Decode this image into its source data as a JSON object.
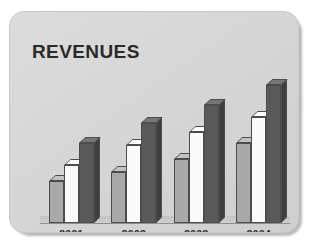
{
  "card": {
    "title": "REVENUES"
  },
  "chart_data": {
    "type": "bar",
    "title": "REVENUES",
    "xlabel": "",
    "ylabel": "",
    "categories": [
      "2001",
      "2002",
      "2003",
      "2004"
    ],
    "series": [
      {
        "name": "light-gray-series",
        "color": "#a9a9a9",
        "values": [
          38,
          46,
          58,
          72
        ]
      },
      {
        "name": "white-series",
        "color": "#fbfbfb",
        "values": [
          52,
          70,
          82,
          95
        ]
      },
      {
        "name": "dark-gray-series",
        "color": "#595959",
        "values": [
          72,
          90,
          106,
          124
        ]
      }
    ],
    "ylim": [
      0,
      135
    ],
    "grid": false,
    "legend": false,
    "style": "3d-extruded-columns"
  },
  "colors": {
    "card_background": "#d6d6d6",
    "title_text": "#2b2b2b",
    "axis_line": "#8e8e8e",
    "bar_light": "#a9a9a9",
    "bar_white": "#fbfbfb",
    "bar_dark": "#595959"
  },
  "axis": {
    "labels": [
      "2001",
      "2002",
      "2003",
      "2004"
    ]
  }
}
